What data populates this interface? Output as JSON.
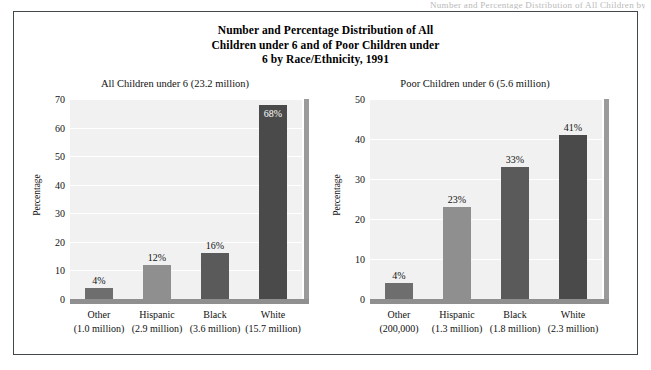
{
  "scan_artifact": "Number and Percentage Distribution of All Children by Race/Ethnicity",
  "figure": {
    "title_line1": "Number and Percentage Distribution of All",
    "title_line2": "Children under 6 and of Poor Children under",
    "title_line3": "6 by Race/Ethnicity, 1991"
  },
  "chart_data": [
    {
      "type": "bar",
      "title": "All Children under 6 (23.2 million)",
      "xlabel": "",
      "ylabel": "Percentage",
      "ylim": [
        0,
        70
      ],
      "yticks": [
        0,
        10,
        20,
        30,
        40,
        50,
        60,
        70
      ],
      "grid": true,
      "legend": "none",
      "categories": [
        "Other",
        "Hispanic",
        "Black",
        "White"
      ],
      "category_sublabels": [
        "(1.0 million)",
        "(2.9 million)",
        "(3.6 million)",
        "(15.7 million)"
      ],
      "values": [
        4,
        12,
        16,
        68
      ],
      "value_labels": [
        "4%",
        "12%",
        "16%",
        "68%"
      ],
      "bar_colors": [
        "#6e6e6e",
        "#8f8f8f",
        "#5a5a5a",
        "#4a4a4a"
      ],
      "label_inside": [
        false,
        false,
        false,
        true
      ]
    },
    {
      "type": "bar",
      "title": "Poor Children under 6 (5.6 million)",
      "xlabel": "",
      "ylabel": "Percentage",
      "ylim": [
        0,
        50
      ],
      "yticks": [
        0,
        10,
        20,
        30,
        40,
        50
      ],
      "grid": true,
      "legend": "none",
      "categories": [
        "Other",
        "Hispanic",
        "Black",
        "White"
      ],
      "category_sublabels": [
        "(200,000)",
        "(1.3 million)",
        "(1.8 million)",
        "(2.3 million)"
      ],
      "values": [
        4,
        23,
        33,
        41
      ],
      "value_labels": [
        "4%",
        "23%",
        "33%",
        "41%"
      ],
      "bar_colors": [
        "#6e6e6e",
        "#8f8f8f",
        "#5a5a5a",
        "#4a4a4a"
      ],
      "label_inside": [
        false,
        false,
        false,
        false
      ]
    }
  ]
}
